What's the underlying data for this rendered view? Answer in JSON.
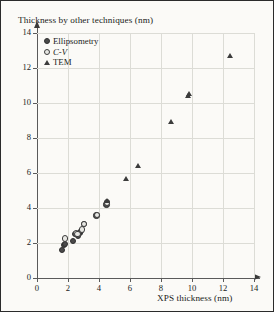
{
  "axes": {
    "y_caption": "Thickness by other techniques (nm)",
    "x_caption": "XPS thickness (nm)"
  },
  "legend": {
    "items": [
      {
        "label": "Ellipsometry",
        "marker": "circle-filled",
        "italic": false
      },
      {
        "label": "C-V",
        "marker": "circle-open",
        "italic": true
      },
      {
        "label": "TEM",
        "marker": "triangle",
        "italic": false
      }
    ]
  },
  "colors": {
    "background": "#fbfaf7",
    "border": "#2b2b2b",
    "grid": "#dcdcd6",
    "axis": "#5a5a5a",
    "marker": "#3c3c3c",
    "text": "#1a1a1a"
  },
  "chart_data": {
    "type": "scatter",
    "title": "",
    "xlabel": "XPS thickness (nm)",
    "ylabel": "Thickness by other techniques (nm)",
    "xlim": [
      0,
      14
    ],
    "ylim": [
      0,
      14
    ],
    "xticks": [
      0,
      2,
      4,
      6,
      8,
      10,
      12,
      14
    ],
    "yticks": [
      0,
      2,
      4,
      6,
      8,
      10,
      12,
      14
    ],
    "grid": true,
    "legend_position": "top-left",
    "series": [
      {
        "name": "Ellipsometry",
        "marker": "circle-filled",
        "points": [
          [
            1.6,
            1.62
          ],
          [
            1.72,
            1.9
          ],
          [
            1.8,
            1.98
          ],
          [
            2.28,
            2.15
          ],
          [
            2.42,
            2.52
          ],
          [
            2.6,
            2.45
          ],
          [
            2.72,
            2.58
          ],
          [
            2.8,
            2.72
          ],
          [
            3.02,
            3.1
          ],
          [
            3.82,
            3.6
          ],
          [
            4.46,
            4.22
          ],
          [
            4.5,
            4.38
          ]
        ]
      },
      {
        "name": "C-V",
        "marker": "circle-open",
        "points": [
          [
            1.8,
            2.28
          ],
          [
            2.48,
            2.6
          ],
          [
            2.58,
            2.52
          ],
          [
            2.86,
            2.8
          ],
          [
            3.02,
            3.12
          ],
          [
            3.84,
            3.62
          ],
          [
            4.48,
            4.3
          ]
        ]
      },
      {
        "name": "TEM",
        "marker": "triangle",
        "points": [
          [
            4.5,
            4.4
          ],
          [
            5.75,
            5.65
          ],
          [
            6.55,
            6.42
          ],
          [
            8.65,
            8.92
          ],
          [
            9.78,
            10.4
          ],
          [
            9.82,
            10.55
          ],
          [
            12.45,
            12.7
          ]
        ]
      }
    ]
  }
}
